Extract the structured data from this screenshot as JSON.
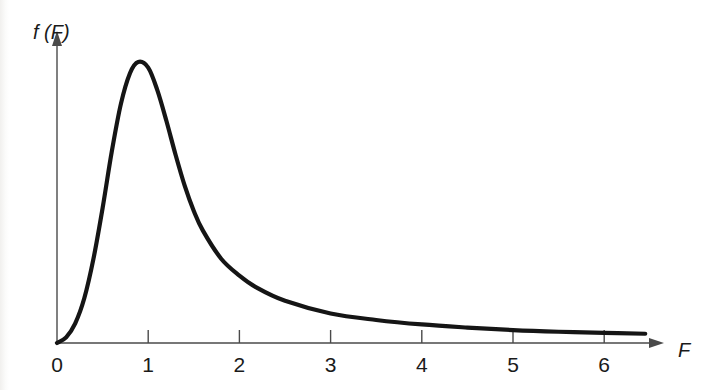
{
  "figure": {
    "background_color": "#ffffff",
    "curve_color": "#151515",
    "axis_color": "#4a4a4a",
    "text_color": "#1a1a1a"
  },
  "axes": {
    "y_label": "f (F)",
    "x_label": "F",
    "origin_label": "0"
  },
  "chart_data": {
    "type": "line",
    "title": "",
    "subtitle": "",
    "xlabel": "F",
    "ylabel": "f (F)",
    "xlim": [
      0,
      6.6
    ],
    "ylim": [
      0,
      1.12
    ],
    "grid": false,
    "legend": null,
    "legend_position": "none",
    "x_ticks": [
      0,
      1,
      2,
      3,
      4,
      5,
      6
    ],
    "x_tick_labels": [
      "0",
      "1",
      "2",
      "3",
      "4",
      "5",
      "6"
    ],
    "y_ticks": [],
    "y_tick_labels": [],
    "annotations": [],
    "series": [
      {
        "name": "f (F)",
        "color": "#151515",
        "x": [
          0.0,
          0.1,
          0.2,
          0.3,
          0.4,
          0.5,
          0.6,
          0.7,
          0.8,
          0.89,
          1.0,
          1.1,
          1.2,
          1.3,
          1.4,
          1.5,
          1.6,
          1.8,
          2.0,
          2.2,
          2.5,
          3.0,
          3.5,
          4.0,
          4.5,
          5.0,
          5.5,
          6.0,
          6.45
        ],
        "y": [
          0.0,
          0.02,
          0.07,
          0.16,
          0.3,
          0.48,
          0.68,
          0.85,
          0.96,
          1.0,
          0.98,
          0.9,
          0.79,
          0.67,
          0.56,
          0.47,
          0.4,
          0.3,
          0.24,
          0.195,
          0.15,
          0.105,
          0.082,
          0.066,
          0.055,
          0.046,
          0.04,
          0.036,
          0.033
        ]
      }
    ]
  },
  "geometry": {
    "origin_px": [
      57,
      343
    ],
    "px_per_unit_x": 91.2,
    "peak_px": [
      136,
      62
    ],
    "x_axis_end_px": 663,
    "y_axis_top_px": 32,
    "curve_end_px": [
      645,
      331
    ]
  }
}
